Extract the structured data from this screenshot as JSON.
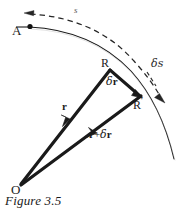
{
  "figure": {
    "caption": "Figure 3.5",
    "domain": "physics-vector-diagram",
    "background_color": "#ffffff",
    "ink_color": "#1a1a1a",
    "faint_ink_color": "#5d5d5d"
  },
  "labels": {
    "point_A": "A",
    "point_R": "R",
    "point_R_prime_base": "R",
    "point_R_prime_mark": "′",
    "point_O": "O",
    "arc_length_s": "s",
    "delta_s": "δs",
    "delta_s_symbol": "δ",
    "delta_s_var": "s",
    "delta_r_symbol": "δ",
    "delta_r_var": "r",
    "vector_r": "r",
    "vector_r_plus": "+",
    "vector_r_plus_delta_r_base": "r",
    "vector_r_plus_delta_r_symbol": "δ",
    "vector_r_plus_delta_r_var": "r"
  },
  "geometry": {
    "origin_O": [
      20,
      185
    ],
    "point_A": [
      31,
      26
    ],
    "point_R": [
      110,
      69
    ],
    "point_R_prime": [
      140,
      96
    ],
    "solid_arc_path": "M 29 27 Q 92 30 130 70 Q 160 103 173 158",
    "dashed_arc_path": "M 27 14 Q 95 18 133 60 Q 152 82 161 98",
    "vector_r_line": [
      20,
      185,
      110,
      69
    ],
    "vector_r_plus_dr_line": [
      20,
      185,
      140,
      96
    ],
    "delta_r_line": [
      110,
      69,
      140,
      96
    ],
    "dashed_left_arrow_tip": [
      28,
      13
    ],
    "dashed_right_arrow_tip": [
      163,
      101
    ],
    "ds_tick_from": [
      147,
      73
    ],
    "ds_tick_to": [
      155,
      85
    ]
  },
  "style": {
    "thick_stroke_width": 3.1,
    "arc_stroke_width": 1.0,
    "dashed_stroke_width": 1.2,
    "dash_pattern": "5 4"
  }
}
